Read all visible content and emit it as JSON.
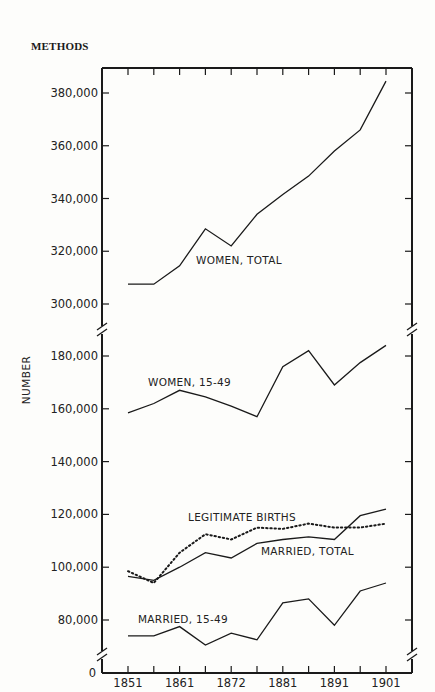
{
  "header": {
    "running_head": "METHODS"
  },
  "chart_data": {
    "type": "line",
    "title": "",
    "xlabel": "",
    "ylabel": "NUMBER",
    "x": [
      1851,
      1856,
      1861,
      1866,
      1872,
      1876,
      1881,
      1886,
      1891,
      1896,
      1901
    ],
    "x_tick_labels": [
      "1851",
      "1861",
      "1872",
      "1881",
      "1891",
      "1901"
    ],
    "y_tick_labels_upper": [
      "380,000",
      "360,000",
      "340,000",
      "320,000",
      "300,000"
    ],
    "y_tick_labels_lower": [
      "180,000",
      "160,000",
      "140,000",
      "120,000",
      "100,000",
      "80,000"
    ],
    "y_zero_label": "0",
    "axis_breaks": "broken y-axis between 300,000 and 180,000, and between 80,000 and 0",
    "ylim_upper": [
      292000,
      389000
    ],
    "ylim_lower": [
      68000,
      189000
    ],
    "grid": false,
    "legend_position": "inline labels",
    "series": [
      {
        "name": "WOMEN, TOTAL",
        "style": "solid",
        "values": [
          307500,
          307500,
          314500,
          328500,
          322000,
          334000,
          341500,
          348500,
          358000,
          366000,
          384500
        ]
      },
      {
        "name": "WOMEN, 15-49",
        "style": "solid",
        "values": [
          158500,
          162000,
          167000,
          164500,
          161000,
          157000,
          176000,
          182000,
          169000,
          177500,
          184000
        ]
      },
      {
        "name": "LEGITIMATE BIRTHS",
        "style": "dotted",
        "values": [
          98500,
          94000,
          105500,
          112500,
          110500,
          115000,
          114500,
          116500,
          115000,
          115000,
          116500
        ]
      },
      {
        "name": "MARRIED, TOTAL",
        "style": "solid",
        "values": [
          96500,
          95000,
          100000,
          105500,
          103500,
          109000,
          110500,
          111500,
          110500,
          119500,
          122000
        ]
      },
      {
        "name": "MARRIED, 15-49",
        "style": "solid",
        "values": [
          74000,
          74000,
          77500,
          70500,
          75000,
          72500,
          86500,
          88000,
          78000,
          91000,
          94000
        ]
      }
    ]
  }
}
